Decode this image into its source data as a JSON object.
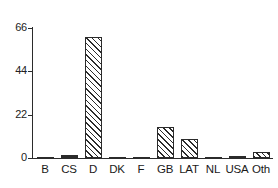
{
  "chart_data": {
    "type": "bar",
    "title": "",
    "subtitle": "",
    "xlabel": "",
    "ylabel": "",
    "categories": [
      "B",
      "CS",
      "D",
      "DK",
      "F",
      "GB",
      "LAT",
      "NL",
      "USA",
      "Oth"
    ],
    "values": [
      0.3,
      1.5,
      61.5,
      0.3,
      0.3,
      15.5,
      9.5,
      0.3,
      1.2,
      3.2
    ],
    "ylim": [
      0,
      66
    ],
    "yticks": [
      0,
      22,
      44,
      66
    ],
    "ytick_labels": [
      "0",
      "22",
      "44",
      "66"
    ],
    "grid": false,
    "legend": null,
    "bar_style": {
      "fill": "diagonal-hatch",
      "hatch_color": "#2b2b2b",
      "face_color": "#ffffff",
      "edge_color": "#2b2b2b"
    },
    "axis_color": "#2b2b2b"
  }
}
